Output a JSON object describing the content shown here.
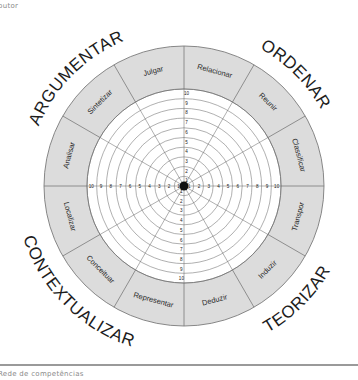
{
  "header": {
    "partial_text": "butor"
  },
  "footer": {
    "caption": "Rede de competências"
  },
  "diagram": {
    "type": "competency-wheel",
    "center": [
      184,
      186
    ],
    "outer_radius": 140,
    "grid_radius": 97,
    "rings": 10,
    "scale_labels": [
      "1",
      "2",
      "3",
      "4",
      "5",
      "6",
      "7",
      "8",
      "9",
      "10"
    ],
    "colors": {
      "segment_fill": "#dcdcdc",
      "line": "#7a7a7a",
      "grid_line": "#6e6e6e",
      "center_dot": "#111111"
    },
    "segments": [
      {
        "label": "Relacionar"
      },
      {
        "label": "Reunir"
      },
      {
        "label": "Classificar"
      },
      {
        "label": "Transpor"
      },
      {
        "label": "Induzir"
      },
      {
        "label": "Deduzir"
      },
      {
        "label": "Representar"
      },
      {
        "label": "Conceituar"
      },
      {
        "label": "Localizar"
      },
      {
        "label": "Analisar"
      },
      {
        "label": "Sintetizar"
      },
      {
        "label": "Julgar"
      }
    ],
    "groups": [
      {
        "label": "ORDENAR",
        "angle": 45
      },
      {
        "label": "TEORIZAR",
        "angle": 135
      },
      {
        "label": "CONTEXTUALIZAR",
        "angle": 225
      },
      {
        "label": "ARGUMENTAR",
        "angle": 315
      }
    ]
  }
}
